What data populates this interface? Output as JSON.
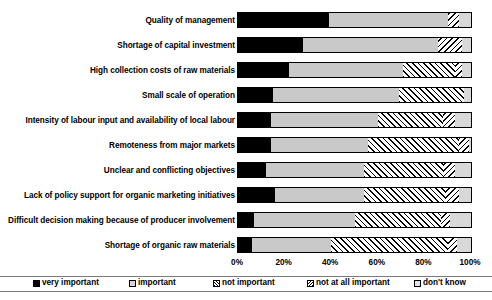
{
  "chart_data": {
    "type": "bar",
    "subtype": "horizontal-stacked-100",
    "title": "",
    "xlabel": "",
    "ylabel": "",
    "xlim": [
      0,
      100
    ],
    "xticks": [
      "0%",
      "20%",
      "40%",
      "60%",
      "80%",
      "100%"
    ],
    "xtick_values": [
      0,
      20,
      40,
      60,
      80,
      100
    ],
    "grid": false,
    "legend_position": "bottom",
    "legend": [
      {
        "name": "very important",
        "pattern": "solid-black",
        "color": "#000000"
      },
      {
        "name": "important",
        "pattern": "solid-light-grey",
        "color": "#c9c9c9"
      },
      {
        "name": "not important",
        "pattern": "forward-hatch",
        "color": "#ffffff"
      },
      {
        "name": "not at all important",
        "pattern": "back-hatch",
        "color": "#ffffff"
      },
      {
        "name": "don't know",
        "pattern": "solid-pale-grey",
        "color": "#d8d8d8"
      }
    ],
    "categories": [
      "Quality of management",
      "Shortage of capital investment",
      "High collection costs of raw materials",
      "Small scale of operation",
      "Intensity of labour input and availability of local labour",
      "Remoteness from major markets",
      "Unclear and conflicting objectives",
      "Lack of policy support for organic marketing initiatives",
      "Difficult decision making because of producer involvement",
      "Shortage of organic raw materials"
    ],
    "series": [
      {
        "name": "very important",
        "values": [
          39,
          28,
          22,
          15,
          14,
          14,
          12,
          16,
          7,
          6
        ]
      },
      {
        "name": "important",
        "values": [
          51,
          58,
          49,
          54,
          46,
          42,
          42,
          38,
          43,
          34
        ]
      },
      {
        "name": "not important",
        "values": [
          0,
          0,
          22,
          28,
          28,
          39,
          34,
          35,
          37,
          50
        ]
      },
      {
        "name": "not at all important",
        "values": [
          5,
          10,
          3,
          0,
          5,
          4,
          5,
          6,
          4,
          4
        ]
      },
      {
        "name": "don't know",
        "values": [
          5,
          4,
          4,
          3,
          7,
          1,
          7,
          5,
          9,
          6
        ]
      }
    ]
  },
  "legend_title": "",
  "axis": {
    "ticks": [
      "0%",
      "20%",
      "40%",
      "60%",
      "80%",
      "100%"
    ]
  }
}
